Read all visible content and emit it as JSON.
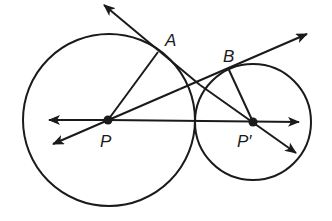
{
  "diagram": {
    "type": "geometry",
    "colors": {
      "stroke": "#1a1a1a",
      "background": "#ffffff"
    },
    "circles": [
      {
        "name": "big-circle",
        "center": "P",
        "cx": 109,
        "cy": 120,
        "r": 86
      },
      {
        "name": "small-circle",
        "center": "P'",
        "cx": 253,
        "cy": 122,
        "r": 58
      }
    ],
    "points": [
      {
        "name": "P",
        "x": 108,
        "y": 120
      },
      {
        "name": "P'",
        "x": 253,
        "y": 122
      },
      {
        "name": "A",
        "x": 158,
        "y": 52
      },
      {
        "name": "B",
        "x": 229,
        "y": 70
      }
    ],
    "labels": {
      "A": "A",
      "B": "B",
      "P": "P",
      "P_prime": "P′"
    },
    "lines": [
      {
        "name": "line-PP'",
        "kind": "line",
        "from": [
          49,
          120
        ],
        "to": [
          299,
          122
        ]
      },
      {
        "name": "tangent-line-A",
        "kind": "line",
        "from": [
          104,
          5
        ],
        "to": [
          296,
          153
        ]
      },
      {
        "name": "tangent-line-B",
        "kind": "line",
        "from": [
          53,
          144
        ],
        "to": [
          307,
          34
        ]
      },
      {
        "name": "segment-PA",
        "kind": "segment",
        "from": [
          108,
          120
        ],
        "to": [
          158,
          52
        ]
      },
      {
        "name": "segment-P'B",
        "kind": "segment",
        "from": [
          253,
          122
        ],
        "to": [
          229,
          70
        ]
      }
    ]
  }
}
